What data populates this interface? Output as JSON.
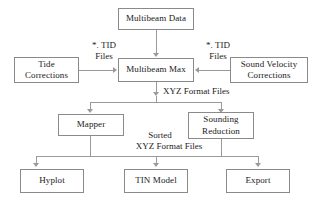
{
  "diagram": {
    "colors": {
      "box_border": "#8a8a8a",
      "connector": "#9a9a9a",
      "text": "#1a1a1a",
      "background": "#ffffff"
    },
    "nodes": {
      "multibeam_data": "Multibeam Data",
      "tide_corrections": "Tide\nCorrections",
      "multibeam_max": "Multibeam Max",
      "sound_velocity_corrections": "Sound Velocity\nCorrections",
      "mapper": "Mapper",
      "sounding_reduction": "Sounding\nReduction",
      "hyplot": "Hyplot",
      "tin_model": "TIN Model",
      "export": "Export"
    },
    "edge_labels": {
      "tid_files_left": "*. TID\nFiles",
      "tid_files_right": "*. TID\nFiles",
      "xyz_format_files": "XYZ Format Files",
      "sorted_label": "Sorted",
      "sorted_xyz_format_files": "XYZ Format Files"
    }
  }
}
